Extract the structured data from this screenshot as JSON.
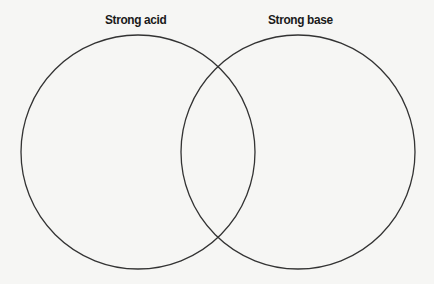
{
  "diagram": {
    "type": "venn",
    "sets": [
      {
        "id": "left",
        "label": "Strong acid",
        "center": [
          138,
          152
        ],
        "radius": 117
      },
      {
        "id": "right",
        "label": "Strong base",
        "center": [
          298,
          152
        ],
        "radius": 117
      }
    ],
    "regions": {
      "left_only": "",
      "overlap": "",
      "right_only": ""
    },
    "colors": {
      "background": "#f6f6f4",
      "stroke": "#333333",
      "label": "#1a1a1a"
    }
  }
}
